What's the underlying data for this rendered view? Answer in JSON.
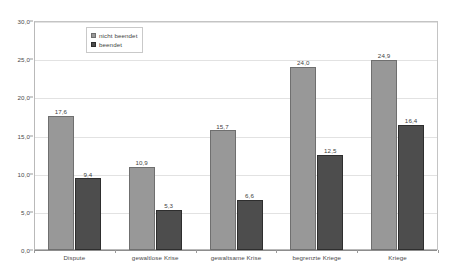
{
  "chart_data": {
    "type": "bar",
    "title": "",
    "subtitle": "",
    "xlabel": "",
    "ylabel": "",
    "ylim": [
      0.0,
      30.0
    ],
    "ytick_labels": [
      "0,0",
      "5,0",
      "10,0",
      "15,0",
      "20,0",
      "25,0",
      "30,0"
    ],
    "ytick_values": [
      0.0,
      5.0,
      10.0,
      15.0,
      20.0,
      25.0,
      30.0
    ],
    "grid": true,
    "grid_axis": "y",
    "legend_position": "top-left-inside",
    "categories": [
      "Dispute",
      "gewaltlose Krise",
      "gewaltsame Krise",
      "begrenzte Kriege",
      "Kriege"
    ],
    "series": [
      {
        "name": "nicht beendet",
        "color": "#989898",
        "values": [
          17.6,
          10.9,
          15.7,
          24.0,
          24.9
        ],
        "value_labels": [
          "17,6",
          "10,9",
          "15,7",
          "24,0",
          "24,9"
        ]
      },
      {
        "name": "beendet",
        "color": "#4d4d4d",
        "values": [
          9.4,
          5.3,
          6.6,
          12.5,
          16.4
        ],
        "value_labels": [
          "9,4",
          "5,3",
          "6,6",
          "12,5",
          "16,4"
        ]
      }
    ]
  },
  "legend": {
    "items": [
      {
        "label": "nicht beendet"
      },
      {
        "label": "beendet"
      }
    ]
  }
}
